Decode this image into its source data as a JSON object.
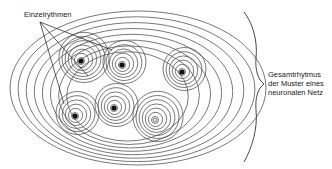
{
  "diagram": {
    "labels": {
      "individual_rhythms": "Einzelrythmen",
      "overall_rhythm": [
        "Gesamtrhytmus",
        "der Muster eines",
        "neuronalen Netz"
      ]
    },
    "colors": {
      "stroke": "#555555",
      "dot": "#111111",
      "background": "#ffffff"
    },
    "outer_ellipse": {
      "cx": 138,
      "cy": 88,
      "rx": 128,
      "ry": 77,
      "rings": 8
    },
    "clusters": [
      {
        "id": "top-left",
        "cx": 81,
        "cy": 61,
        "rings": 7,
        "filled_center": true
      },
      {
        "id": "top-middle",
        "cx": 122,
        "cy": 65,
        "rings": 6,
        "filled_center": true
      },
      {
        "id": "right",
        "cx": 182,
        "cy": 72,
        "rings": 6,
        "filled_center": true
      },
      {
        "id": "bottom-left",
        "cx": 75,
        "cy": 116,
        "rings": 6,
        "filled_center": true
      },
      {
        "id": "bottom-middle",
        "cx": 114,
        "cy": 108,
        "rings": 6,
        "filled_center": true
      },
      {
        "id": "bottom-right",
        "cx": 155,
        "cy": 120,
        "rings": 7,
        "filled_center": false
      }
    ]
  }
}
